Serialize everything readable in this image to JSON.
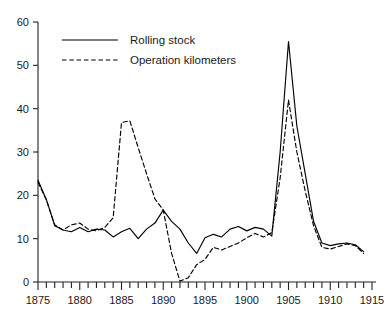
{
  "chart_data": {
    "type": "line",
    "title": "",
    "xlabel": "",
    "ylabel": "",
    "xlim": [
      1875,
      1915
    ],
    "ylim": [
      0,
      60
    ],
    "grid": false,
    "legend_position": "top-left",
    "y_ticks": [
      0,
      10,
      20,
      30,
      40,
      50,
      60
    ],
    "x_ticks": [
      1875,
      1880,
      1885,
      1890,
      1895,
      1900,
      1905,
      1910,
      1915
    ],
    "x_minor_tick_step": 1,
    "x": [
      1875,
      1876,
      1877,
      1878,
      1879,
      1880,
      1881,
      1882,
      1883,
      1884,
      1885,
      1886,
      1887,
      1888,
      1889,
      1890,
      1891,
      1892,
      1893,
      1894,
      1895,
      1896,
      1897,
      1898,
      1899,
      1900,
      1901,
      1902,
      1903,
      1904,
      1905,
      1906,
      1907,
      1908,
      1909,
      1910,
      1911,
      1912,
      1913,
      1914
    ],
    "series": [
      {
        "name": "Rolling stock",
        "style": "solid",
        "color": "#000000",
        "values": [
          23.5,
          19.0,
          13.0,
          12.0,
          11.6,
          12.6,
          11.6,
          12.2,
          12.0,
          10.4,
          11.6,
          12.4,
          10.0,
          12.2,
          13.6,
          16.6,
          14.0,
          12.2,
          9.0,
          6.6,
          10.2,
          11.0,
          10.4,
          12.2,
          12.8,
          11.8,
          12.6,
          12.2,
          10.6,
          30.0,
          55.5,
          36.0,
          25.0,
          14.0,
          9.0,
          8.4,
          8.8,
          9.0,
          8.6,
          7.0
        ]
      },
      {
        "name": "Operation kilometers",
        "style": "dashed",
        "color": "#000000",
        "values": [
          23.0,
          19.0,
          13.2,
          12.0,
          13.2,
          13.6,
          12.2,
          11.8,
          12.6,
          14.8,
          36.8,
          37.2,
          31.0,
          25.0,
          19.2,
          16.6,
          6.6,
          0.2,
          1.0,
          4.0,
          5.2,
          8.0,
          7.4,
          8.2,
          9.0,
          10.2,
          11.2,
          10.4,
          11.4,
          24.0,
          42.0,
          30.0,
          21.0,
          13.0,
          8.0,
          7.6,
          8.2,
          8.8,
          8.4,
          6.6
        ]
      }
    ]
  },
  "legend": {
    "items": [
      {
        "label": "Rolling stock",
        "style": "solid"
      },
      {
        "label": "Operation kilometers",
        "style": "dashed"
      }
    ]
  }
}
